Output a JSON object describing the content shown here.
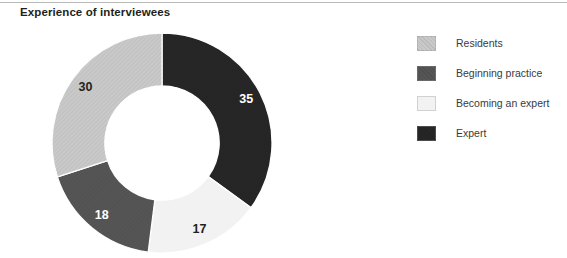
{
  "figure": {
    "title": "Experience of interviewees",
    "background_color": "#ffffff",
    "title_color": "#231f20",
    "rule_color": "#b9b9b9"
  },
  "legend": {
    "position": "right",
    "items": [
      {
        "label": "Residents",
        "color": "#c9c9c9",
        "hatched": true,
        "label_color": "#3a3a3a"
      },
      {
        "label": "Beginning practice",
        "color": "#555555",
        "hatched": true,
        "label_color": "#3a3a3a"
      },
      {
        "label": "Becoming an expert",
        "color": "#f2f2f2",
        "hatched": false,
        "label_color": "#3a3a3a"
      },
      {
        "label": "Expert",
        "color": "#262626",
        "hatched": true,
        "label_color": "#3a3a3a"
      }
    ]
  },
  "chart_data": {
    "type": "pie",
    "variant": "donut",
    "title": "Experience of interviewees",
    "xlabel": "",
    "ylabel": "",
    "total": 100,
    "hole_ratio": 0.52,
    "start_angle_deg": 0,
    "direction": "clockwise",
    "categories": [
      "Expert",
      "Becoming an expert",
      "Beginning practice",
      "Residents"
    ],
    "values": [
      35,
      17,
      18,
      30
    ],
    "slices": [
      {
        "label": "Expert",
        "value": 35,
        "display": "35",
        "color": "#262626",
        "text_color": "#ffffff",
        "hatched": true
      },
      {
        "label": "Becoming an expert",
        "value": 17,
        "display": "17",
        "color": "#f2f2f2",
        "text_color": "#231f20",
        "hatched": false
      },
      {
        "label": "Beginning practice",
        "value": 18,
        "display": "18",
        "color": "#555555",
        "text_color": "#ffffff",
        "hatched": true
      },
      {
        "label": "Residents",
        "value": 30,
        "display": "30",
        "color": "#c9c9c9",
        "text_color": "#231f20",
        "hatched": true
      }
    ],
    "legend": [
      "Residents",
      "Beginning practice",
      "Becoming an expert",
      "Expert"
    ],
    "grid": false
  }
}
